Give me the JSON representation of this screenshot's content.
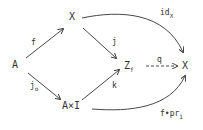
{
  "diagram": {
    "nodes": {
      "A": "A",
      "X_top": "X",
      "AxI": "A×I",
      "Zf_main": "Z",
      "Zf_sub": "f",
      "X_right": "X"
    },
    "arrows": {
      "f": "f",
      "j0_main": "j",
      "j0_sub": "o",
      "j": "j",
      "k": "k",
      "q": "q",
      "idX_main": "id",
      "idX_sub": "X",
      "fpr_main": "f•pr",
      "fpr_sub": "1"
    },
    "colors": {
      "ink": "#333333",
      "background": "#ffffff"
    }
  }
}
